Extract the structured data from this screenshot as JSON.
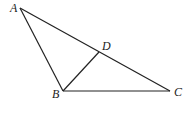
{
  "diagram": {
    "type": "triangle-with-segment",
    "points": {
      "A": {
        "label": "A",
        "x": 20,
        "y": 8
      },
      "B": {
        "label": "B",
        "x": 63,
        "y": 91
      },
      "C": {
        "label": "C",
        "x": 170,
        "y": 91
      },
      "D": {
        "label": "D",
        "x": 99,
        "y": 52
      }
    },
    "segments": [
      [
        "A",
        "B"
      ],
      [
        "A",
        "C"
      ],
      [
        "B",
        "C"
      ],
      [
        "B",
        "D"
      ]
    ],
    "colors": {
      "stroke": "#222222",
      "background": "#ffffff"
    }
  }
}
